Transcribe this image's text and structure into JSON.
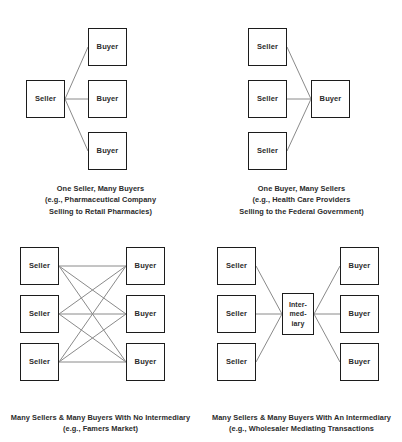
{
  "diagram": {
    "title_visible": false,
    "colors": {
      "background": "#ffffff",
      "box_border": "#1c1c1c",
      "connector_line": "#8a8a8a",
      "text": "#2b2b2b"
    },
    "labels": {
      "seller": "Seller",
      "buyer": "Buyer",
      "intermediary_line1": "Inter-",
      "intermediary_line2": "med-",
      "intermediary_line3": "iary"
    },
    "panels": [
      {
        "id": "one-seller-many-buyers",
        "sellers": [
          "Seller"
        ],
        "buyers": [
          "Buyer",
          "Buyer",
          "Buyer"
        ],
        "intermediary": null,
        "connections": "1 seller to 3 buyers",
        "caption_lines": [
          "One Seller, Many Buyers",
          "(e.g., Pharmaceutical Company",
          "Selling to Retail Pharmacies)"
        ]
      },
      {
        "id": "one-buyer-many-sellers",
        "sellers": [
          "Seller",
          "Seller",
          "Seller"
        ],
        "buyers": [
          "Buyer"
        ],
        "intermediary": null,
        "connections": "3 sellers to 1 buyer",
        "caption_lines": [
          "One Buyer, Many Sellers",
          "(e.g., Health Care Providers",
          "Selling to the Federal Government)"
        ]
      },
      {
        "id": "many-sellers-many-buyers-no-intermediary",
        "sellers": [
          "Seller",
          "Seller",
          "Seller"
        ],
        "buyers": [
          "Buyer",
          "Buyer",
          "Buyer"
        ],
        "intermediary": null,
        "connections": "full bipartite, 9 lines",
        "caption_lines": [
          "Many Sellers & Many Buyers With No Intermediary",
          "(e.g., Famers Market)"
        ]
      },
      {
        "id": "many-sellers-many-buyers-with-intermediary",
        "sellers": [
          "Seller",
          "Seller",
          "Seller"
        ],
        "buyers": [
          "Buyer",
          "Buyer",
          "Buyer"
        ],
        "intermediary": "Inter-med-iary",
        "connections": "3 sellers to intermediary to 3 buyers",
        "caption_lines": [
          "Many Sellers & Many Buyers With An Intermediary",
          "(e.g., Wholesaler Mediating Transactions"
        ]
      }
    ]
  }
}
